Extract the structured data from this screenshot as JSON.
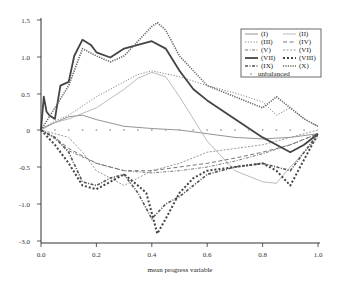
{
  "chart_data": {
    "type": "line",
    "title": "",
    "xlabel": "mean progress variable",
    "ylabel": "",
    "xlim": [
      0.0,
      1.0
    ],
    "ylim": [
      -1.5,
      1.5
    ],
    "grid": false,
    "legend_position": "upper right",
    "x_ticks": [
      "0.0",
      "0.2",
      "0.4",
      "0.6",
      "0.8",
      "1.0"
    ],
    "y_ticks": [
      "1.5",
      "1.0",
      "0.5",
      "0",
      "-0.5",
      "-1.0",
      "-3.0"
    ],
    "series": [
      {
        "name": "(I)",
        "style": "solid-thin",
        "color": "#888888",
        "x": [
          0,
          0.05,
          0.1,
          0.15,
          0.2,
          0.3,
          0.4,
          0.5,
          0.6,
          0.7,
          0.8,
          0.9,
          1.0
        ],
        "y": [
          0.02,
          0.1,
          0.18,
          0.2,
          0.14,
          0.05,
          0.02,
          0.0,
          -0.05,
          -0.1,
          -0.12,
          -0.1,
          -0.05
        ]
      },
      {
        "name": "(II)",
        "style": "solid-light",
        "color": "#aaaaaa",
        "x": [
          0,
          0.05,
          0.1,
          0.2,
          0.3,
          0.35,
          0.4,
          0.45,
          0.5,
          0.6,
          0.7,
          0.8,
          0.85,
          0.9,
          0.95,
          1.0
        ],
        "y": [
          0.0,
          0.1,
          0.15,
          0.3,
          0.55,
          0.7,
          0.78,
          0.72,
          0.45,
          -0.15,
          -0.55,
          -0.7,
          -0.72,
          -0.5,
          -0.3,
          -0.1
        ]
      },
      {
        "name": "(III)",
        "style": "dotted",
        "color": "#888888",
        "x": [
          0,
          0.05,
          0.1,
          0.2,
          0.3,
          0.35,
          0.4,
          0.5,
          0.6,
          0.7,
          0.8,
          0.85,
          0.9,
          0.95,
          1.0
        ],
        "y": [
          0.0,
          0.12,
          0.2,
          0.45,
          0.65,
          0.75,
          0.8,
          0.72,
          0.6,
          0.5,
          0.38,
          0.2,
          0.3,
          0.15,
          0.05
        ]
      },
      {
        "name": "(IV)",
        "style": "dashed",
        "color": "#777777",
        "x": [
          0,
          0.05,
          0.1,
          0.2,
          0.3,
          0.4,
          0.5,
          0.6,
          0.7,
          0.8,
          0.9,
          1.0
        ],
        "y": [
          0.0,
          -0.1,
          -0.25,
          -0.45,
          -0.55,
          -0.55,
          -0.5,
          -0.45,
          -0.38,
          -0.3,
          -0.2,
          -0.05
        ]
      },
      {
        "name": "(V)",
        "style": "dash-dot",
        "color": "#777777",
        "x": [
          0,
          0.05,
          0.1,
          0.2,
          0.3,
          0.4,
          0.5,
          0.6,
          0.7,
          0.8,
          0.9,
          1.0
        ],
        "y": [
          0.0,
          -0.12,
          -0.28,
          -0.45,
          -0.55,
          -0.58,
          -0.55,
          -0.5,
          -0.42,
          -0.32,
          -0.2,
          -0.05
        ]
      },
      {
        "name": "(VI)",
        "style": "dash-dense",
        "color": "#999999",
        "x": [
          0,
          0.05,
          0.1,
          0.15,
          0.2,
          0.3,
          0.4,
          0.5,
          0.6,
          0.7,
          0.8,
          0.9,
          1.0
        ],
        "y": [
          0.0,
          -0.05,
          -0.1,
          -0.3,
          -0.55,
          -0.75,
          -0.55,
          -0.45,
          -0.3,
          -0.25,
          -0.2,
          -0.1,
          0.0
        ]
      },
      {
        "name": "(VII)",
        "style": "solid-thick",
        "color": "#444444",
        "x": [
          0,
          0.01,
          0.02,
          0.03,
          0.05,
          0.07,
          0.1,
          0.12,
          0.15,
          0.18,
          0.2,
          0.25,
          0.3,
          0.35,
          0.4,
          0.45,
          0.5,
          0.55,
          0.6,
          0.7,
          0.8,
          0.85,
          0.9,
          0.95,
          1.0
        ],
        "y": [
          0.0,
          0.45,
          0.25,
          0.2,
          0.15,
          0.6,
          0.65,
          1.0,
          1.22,
          1.15,
          1.05,
          0.98,
          1.1,
          1.15,
          1.2,
          1.1,
          0.8,
          0.55,
          0.4,
          0.15,
          -0.1,
          -0.2,
          -0.3,
          -0.2,
          -0.05
        ]
      },
      {
        "name": "(VIII)",
        "style": "dotted-thick",
        "color": "#444444",
        "x": [
          0,
          0.05,
          0.1,
          0.15,
          0.2,
          0.25,
          0.3,
          0.35,
          0.38,
          0.42,
          0.45,
          0.5,
          0.55,
          0.6,
          0.7,
          0.8,
          0.85,
          0.9,
          0.95,
          1.0
        ],
        "y": [
          0.0,
          -0.2,
          -0.45,
          -0.75,
          -0.8,
          -0.7,
          -0.6,
          -0.75,
          -0.85,
          -1.4,
          -1.2,
          -0.85,
          -0.65,
          -0.55,
          -0.5,
          -0.45,
          -0.55,
          -0.75,
          -0.4,
          -0.05
        ]
      },
      {
        "name": "(IX)",
        "style": "dash-dot-thick",
        "color": "#555555",
        "x": [
          0,
          0.05,
          0.1,
          0.15,
          0.2,
          0.25,
          0.3,
          0.35,
          0.4,
          0.45,
          0.5,
          0.55,
          0.6,
          0.7,
          0.8,
          0.9,
          1.0
        ],
        "y": [
          0.0,
          -0.1,
          -0.3,
          -0.7,
          -0.75,
          -0.65,
          -0.6,
          -0.85,
          -1.2,
          -1.0,
          -0.9,
          -0.75,
          -0.6,
          -0.5,
          -0.45,
          -0.55,
          -0.05
        ]
      },
      {
        "name": "(X)",
        "style": "dotted-dense",
        "color": "#666666",
        "x": [
          0,
          0.05,
          0.1,
          0.15,
          0.2,
          0.25,
          0.3,
          0.35,
          0.4,
          0.42,
          0.45,
          0.5,
          0.6,
          0.7,
          0.8,
          0.85,
          0.9,
          0.95,
          1.0
        ],
        "y": [
          0.0,
          0.3,
          0.6,
          1.1,
          1.0,
          0.92,
          1.0,
          1.2,
          1.4,
          1.45,
          1.35,
          1.0,
          0.6,
          0.45,
          0.3,
          0.45,
          0.3,
          0.15,
          0.05
        ]
      },
      {
        "name": "unbalanced",
        "style": "markers",
        "color": "#aaaaaa",
        "x": [
          0.05,
          0.1,
          0.15,
          0.2,
          0.25,
          0.3,
          0.35,
          0.4,
          0.45,
          0.5,
          0.55,
          0.6,
          0.65,
          0.7,
          0.75,
          0.8,
          0.85,
          0.9,
          0.95
        ],
        "y": [
          0.0,
          0.0,
          0.0,
          0.0,
          0.0,
          0.0,
          0.0,
          0.0,
          0.0,
          0.0,
          0.0,
          0.0,
          0.0,
          0.0,
          0.0,
          0.0,
          0.0,
          0.0,
          0.0
        ]
      }
    ]
  },
  "legend": {
    "items": [
      "(I)",
      "(II)",
      "(III)",
      "(IV)",
      "(V)",
      "(VI)",
      "(VII)",
      "(VIII)",
      "(IX)",
      "(X)",
      "unbalanced"
    ]
  }
}
